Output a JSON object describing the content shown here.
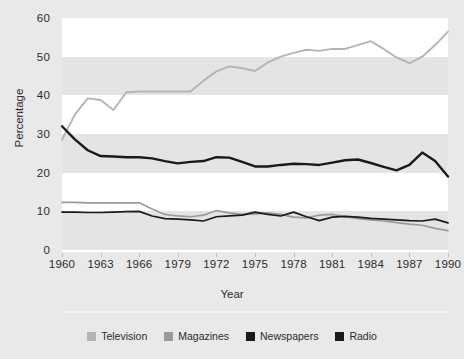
{
  "chart_data": {
    "type": "line",
    "title": "",
    "xlabel": "Year",
    "ylabel": "Percentage",
    "ylim": [
      0,
      60
    ],
    "ytick_values": [
      0,
      10,
      20,
      30,
      40,
      50,
      60
    ],
    "ytick_labels": [
      "0",
      "10",
      "20",
      "30",
      "40",
      "50",
      "60"
    ],
    "xlim": [
      1960,
      1990
    ],
    "x": [
      1960,
      1961,
      1962,
      1963,
      1964,
      1965,
      1966,
      1967,
      1968,
      1969,
      1970,
      1971,
      1972,
      1973,
      1974,
      1975,
      1976,
      1977,
      1978,
      1979,
      1980,
      1981,
      1982,
      1983,
      1984,
      1985,
      1986,
      1987,
      1988,
      1989,
      1990
    ],
    "xtick_values": [
      1960,
      1963,
      1966,
      1969,
      1972,
      1975,
      1978,
      1981,
      1984,
      1987,
      1990
    ],
    "xtick_labels": [
      "1960",
      "1963",
      "1966",
      "1979",
      "1972",
      "1975",
      "1978",
      "1981",
      "1984",
      "1987",
      "1990"
    ],
    "grid": "horizontal-bands",
    "legend_position": "bottom",
    "series": [
      {
        "name": "Television",
        "color": "#b4b4b4",
        "values": [
          28.5,
          35.0,
          39.2,
          38.8,
          36.2,
          40.8,
          41.0,
          41.0,
          41.0,
          41.0,
          41.0,
          43.8,
          46.2,
          47.5,
          47.0,
          46.3,
          48.5,
          50.0,
          51.0,
          51.8,
          51.5,
          52.0,
          52.0,
          53.0,
          54.0,
          52.0,
          49.8,
          48.3,
          50.0,
          53.0,
          56.5
        ]
      },
      {
        "name": "Magazines",
        "color": "#9a9a9a",
        "values": [
          12.3,
          12.3,
          12.2,
          12.2,
          12.2,
          12.2,
          12.2,
          10.6,
          9.2,
          8.8,
          8.6,
          9.0,
          10.2,
          9.6,
          9.2,
          9.3,
          9.6,
          9.2,
          8.5,
          8.3,
          9.0,
          9.2,
          8.6,
          8.1,
          7.8,
          7.5,
          7.1,
          6.7,
          6.4,
          5.6,
          5.0
        ]
      },
      {
        "name": "Newspapers",
        "color": "#1a1a1a",
        "values": [
          32.0,
          28.6,
          25.8,
          24.3,
          24.2,
          24.0,
          24.0,
          23.7,
          23.0,
          22.4,
          22.8,
          23.0,
          24.0,
          23.9,
          22.8,
          21.6,
          21.6,
          22.0,
          22.3,
          22.2,
          22.0,
          22.6,
          23.2,
          23.4,
          22.5,
          21.5,
          20.6,
          22.0,
          25.2,
          23.0,
          19.0
        ]
      },
      {
        "name": "Radio",
        "color": "#1a1a1a",
        "values": [
          9.8,
          9.8,
          9.7,
          9.7,
          9.8,
          9.9,
          10.0,
          8.8,
          8.1,
          8.0,
          7.8,
          7.5,
          8.6,
          8.8,
          9.0,
          9.8,
          9.2,
          8.8,
          9.8,
          8.6,
          7.6,
          8.5,
          8.7,
          8.5,
          8.2,
          8.0,
          7.8,
          7.6,
          7.5,
          8.0,
          7.0
        ]
      }
    ]
  },
  "legend": {
    "items": [
      {
        "label": "Television",
        "color": "#b4b4b4"
      },
      {
        "label": "Magazines",
        "color": "#9a9a9a"
      },
      {
        "label": "Newspapers",
        "color": "#1a1a1a"
      },
      {
        "label": "Radio",
        "color": "#1a1a1a"
      }
    ]
  },
  "axes": {
    "y_title": "Percentage",
    "x_title": "Year"
  },
  "colors": {
    "card_background": "#e9e9e9",
    "band_white": "#ffffff",
    "band_grey": "#e4e4e4",
    "text": "#2b2b2b",
    "baseline": "#ffffff"
  }
}
